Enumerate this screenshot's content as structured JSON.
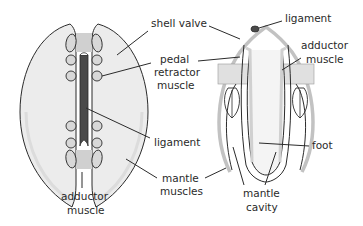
{
  "diagram": {
    "views": [
      {
        "id": "top-view",
        "description": "dorsal view of bivalve with two valves"
      },
      {
        "id": "cross-section",
        "description": "transverse section of bivalve"
      }
    ],
    "labels": {
      "shell_valve": "shell valve",
      "pedal_retractor_1": "pedal",
      "pedal_retractor_2": "retractor",
      "pedal_retractor_3": "muscle",
      "ligament_left": "ligament",
      "mantle_muscles_1": "mantle",
      "mantle_muscles_2": "muscles",
      "adductor_left_1": "adductor",
      "adductor_left_2": "muscle",
      "ligament_right": "ligament",
      "adductor_right_1": "adductor",
      "adductor_right_2": "muscle",
      "foot": "foot",
      "mantle_cavity_1": "mantle",
      "mantle_cavity_2": "cavity"
    },
    "colors": {
      "outline": "#2b2b2b",
      "shell_fill": "#ececec",
      "muscle_fill": "#d0d0d0",
      "ligament_fill": "#4a4a4a",
      "shell_rim": "#bdbdbd"
    }
  }
}
